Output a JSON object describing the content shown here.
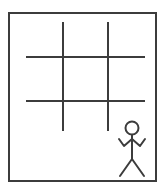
{
  "canvas": {
    "width": 165,
    "height": 194,
    "background_color": "#ffffff",
    "title": "Tic-Tac-Toe Grid with Stick Figure"
  },
  "frame": {
    "label": "Outer border frame",
    "x": 8,
    "y": 12,
    "width": 149,
    "height": 170,
    "stroke_color": "#3c3c3c",
    "stroke_width": 2,
    "fill_color": "#ffffff"
  },
  "grid": {
    "label": "Tic-tac-toe grid",
    "stroke_color": "#3c3c3c",
    "stroke_width": 2,
    "cells": 9,
    "rows": 3,
    "columns": 3,
    "vertical_lines": [
      {
        "name": "vertical-line-left",
        "x": 63,
        "y1": 22,
        "y2": 131
      },
      {
        "name": "vertical-line-right",
        "x": 108,
        "y1": 22,
        "y2": 131
      }
    ],
    "horizontal_lines": [
      {
        "name": "horizontal-line-top",
        "y": 57,
        "x1": 26,
        "x2": 145
      },
      {
        "name": "horizontal-line-bottom",
        "y": 101,
        "x1": 26,
        "x2": 145
      }
    ]
  },
  "stick_figure": {
    "label": "Stick figure person",
    "stroke_color": "#3c3c3c",
    "stroke_width": 2,
    "position": "bottom-right",
    "head": {
      "cx": 132,
      "cy": 128,
      "r": 6.5
    },
    "body": {
      "x1": 132,
      "y1": 135,
      "x2": 132,
      "y2": 159
    },
    "arms_path": "M 119 139 L 124 146 L 132 139 L 140 146 L 145 139",
    "left_leg": {
      "x1": 132,
      "y1": 159,
      "x2": 120,
      "y2": 176
    },
    "right_leg": {
      "x1": 132,
      "y1": 159,
      "x2": 144,
      "y2": 176
    }
  },
  "accessibility": {
    "description": "A drawing of an empty tic-tac-toe board inside a rectangular frame, with a stick figure standing in the lower right corner."
  }
}
